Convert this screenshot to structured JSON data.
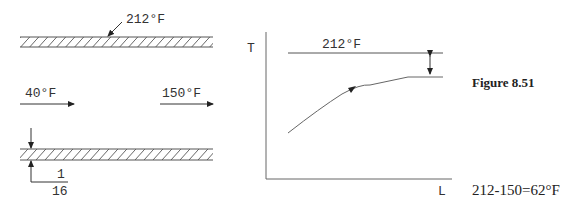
{
  "pipe_diagram": {
    "wall_temperature_label": "212°F",
    "inlet_temperature_label": "40°F",
    "outlet_temperature_label": "150°F",
    "wall_thickness_numerator": "1",
    "wall_thickness_denominator": "16"
  },
  "graph": {
    "y_axis_label": "T",
    "x_axis_label": "L",
    "wall_line_label": "212°F"
  },
  "figure_caption": "Figure 8.51",
  "result_text": "212-150=62°F",
  "colors": {
    "line": "#555555",
    "text": "#333333",
    "background": "#ffffff"
  }
}
